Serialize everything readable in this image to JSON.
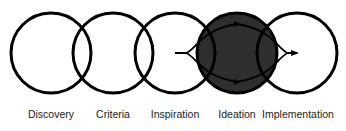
{
  "diagram": {
    "type": "overlapping-circles-process",
    "stages": [
      {
        "label": "Discovery",
        "cx": 51,
        "highlighted": false
      },
      {
        "label": "Criteria",
        "cx": 113,
        "highlighted": false
      },
      {
        "label": "Inspiration",
        "cx": 175,
        "highlighted": false
      },
      {
        "label": "Ideation",
        "cx": 237,
        "highlighted": true
      },
      {
        "label": "Implementation",
        "cx": 297,
        "highlighted": false
      }
    ],
    "circle_radius": 40,
    "circle_cy": 53,
    "colors": {
      "stroke": "#000000",
      "highlight_fill": "#2e2e2e",
      "background": "#ffffff",
      "label_text": "#222222"
    },
    "flow": {
      "description": "Lens-shaped loop arrows from Inspiration center through Ideation to Implementation center",
      "start": [
        175,
        53
      ],
      "end": [
        297,
        53
      ]
    }
  }
}
